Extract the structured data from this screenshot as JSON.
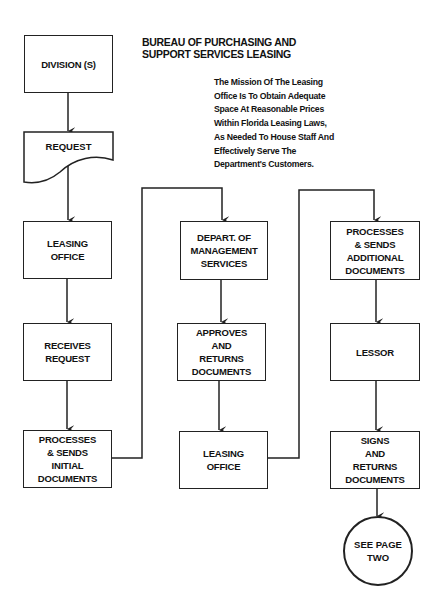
{
  "header": {
    "title": "BUREAU OF PURCHASING AND\nSUPPORT SERVICES LEASING",
    "mission": "The Mission Of The Leasing\nOffice Is To Obtain Adequate\nSpace At Reasonable Prices\nWithin Florida Leasing Laws,\nAs Needed To House Staff And\nEffectively Serve The\nDepartment's Customers."
  },
  "flow": {
    "column1": {
      "division": "DIVISION (S)",
      "request": "REQUEST",
      "leasing_office": "LEASING\nOFFICE",
      "receives_request": "RECEIVES\nREQUEST",
      "processes_initial": "PROCESSES\n& SENDS\nINITIAL\nDOCUMENTS"
    },
    "column2": {
      "dms": "DEPART. OF\nMANAGEMENT\nSERVICES",
      "approves": "APPROVES\nAND\nRETURNS\nDOCUMENTS",
      "leasing_office": "LEASING\nOFFICE"
    },
    "column3": {
      "processes_additional": "PROCESSES\n& SENDS\nADDITIONAL\nDOCUMENTS",
      "lessor": "LESSOR",
      "signs_returns": "SIGNS\nAND\nRETURNS\nDOCUMENTS",
      "connector": "SEE PAGE\nTWO"
    }
  },
  "colors": {
    "line": "#222222",
    "background": "#ffffff",
    "text": "#111111"
  }
}
